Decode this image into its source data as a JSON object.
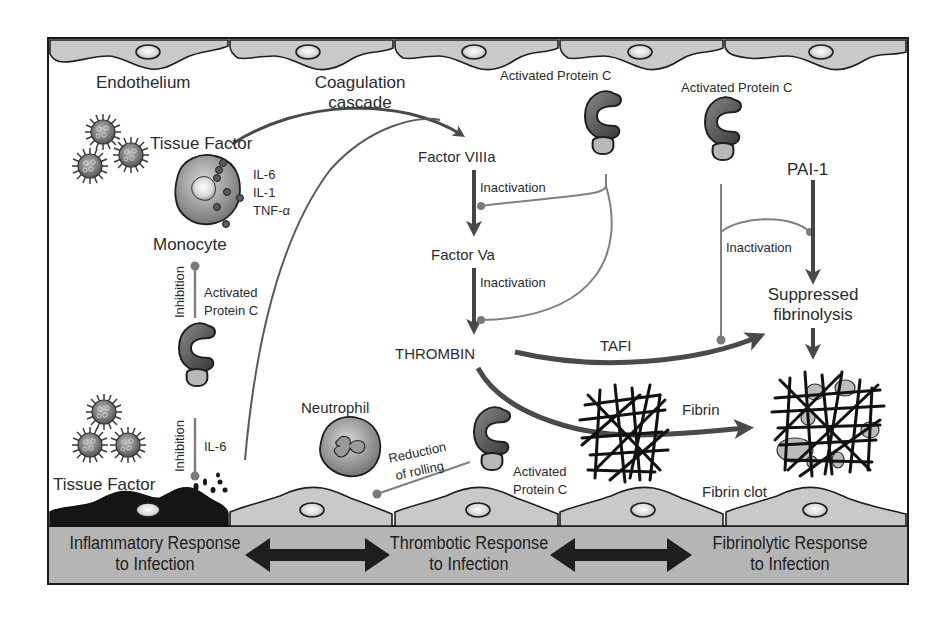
{
  "diagram": {
    "title_labels": {
      "endothelium": "Endothelium",
      "coagulation_cascade_line1": "Coagulation",
      "coagulation_cascade_line2": "cascade",
      "tissue_factor_top": "Tissue Factor",
      "tissue_factor_bottom": "Tissue Factor",
      "monocyte": "Monocyte",
      "neutrophil": "Neutrophil",
      "cytokines": [
        "IL-6",
        "IL-1",
        "TNF-α"
      ],
      "il6_lower": "IL-6",
      "inhibition_upper": "Inhibition",
      "inhibition_lower": "Inhibition",
      "apc_left_line1": "Activated",
      "apc_left_line2": "Protein C",
      "apc_top_center": "Activated Protein C",
      "apc_top_right": "Activated Protein C",
      "apc_bottom_line1": "Activated",
      "apc_bottom_line2": "Protein C",
      "reduction_line1": "Reduction",
      "reduction_line2": "of rolling",
      "factor_viiia": "Factor VIIIa",
      "factor_va": "Factor Va",
      "inactivation_1": "Inactivation",
      "inactivation_2": "Inactivation",
      "inactivation_3": "Inactivation",
      "thrombin": "THROMBIN",
      "tafi": "TAFI",
      "pai1": "PAI-1",
      "suppressed_line1": "Suppressed",
      "suppressed_line2": "fibrinolysis",
      "fibrin": "Fibrin",
      "fibrin_clot": "Fibrin clot"
    },
    "bottom_band": {
      "left_line1": "Inflammatory Response",
      "left_line2": "to Infection",
      "center_line1": "Thrombotic Response",
      "center_line2": "to Infection",
      "right_line1": "Fibrinolytic Response",
      "right_line2": "to Infection"
    },
    "colors": {
      "background": "#ffffff",
      "border": "#1a1a1a",
      "cell_fill": "#c9c9c9",
      "band_fill": "#b5b5b5",
      "arrow_dark": "#4a4a4a",
      "arrow_light": "#8a8a8a",
      "damaged_cell": "#151515"
    }
  }
}
